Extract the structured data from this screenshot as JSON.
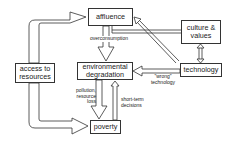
{
  "diagram": {
    "nodes": {
      "affluence": "affluence",
      "culture_values_line1": "culture &",
      "culture_values_line2": "values",
      "access_line1": "access to",
      "access_line2": "resources",
      "env_line1": "environmental",
      "env_line2": "degradation",
      "technology": "technology",
      "poverty": "poverty"
    },
    "edge_labels": {
      "overconsumption": "overconsumption",
      "pollution_line1": "pollution,",
      "pollution_line2": "resource",
      "pollution_line3": "loss",
      "shortterm_line1": "short-term",
      "shortterm_line2": "decisions",
      "wrong_line1": "\"wrong\"",
      "wrong_line2": "technology"
    },
    "edges": [
      {
        "from": "access to resources",
        "to": "affluence",
        "style": "wide-hollow"
      },
      {
        "from": "access to resources",
        "to": "poverty",
        "style": "wide-hollow"
      },
      {
        "from": "affluence",
        "to": "environmental degradation",
        "label": "overconsumption",
        "style": "wide-hollow"
      },
      {
        "from": "environmental degradation",
        "to": "poverty",
        "label": "pollution, resource loss",
        "style": "wide-hollow"
      },
      {
        "from": "poverty",
        "to": "environmental degradation",
        "label": "short-term decisions",
        "style": "narrow-hollow"
      },
      {
        "from": "technology",
        "to": "environmental degradation",
        "label": "\"wrong\" technology",
        "style": "narrow-hollow"
      },
      {
        "from": "technology",
        "to": "affluence",
        "style": "narrow-hollow"
      },
      {
        "from": "culture & values",
        "to": "affluence",
        "style": "double-line"
      },
      {
        "from": "culture & values",
        "to": "technology",
        "style": "bidirectional"
      }
    ]
  }
}
